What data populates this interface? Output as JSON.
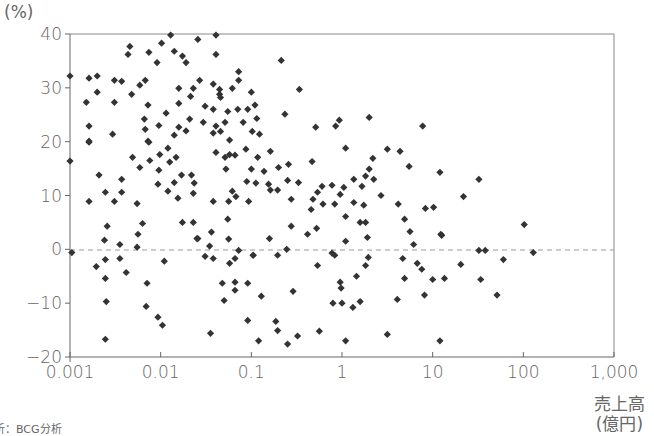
{
  "chart_data": {
    "type": "scatter",
    "title": "",
    "xlabel": "売上高（億円）",
    "ylabel": "(%)",
    "xscale": "log",
    "xlim": [
      0.001,
      1000
    ],
    "ylim": [
      -20,
      40
    ],
    "x_ticks": [
      "0.001",
      "0.01",
      "0.1",
      "1",
      "10",
      "100",
      "1,000"
    ],
    "y_ticks": [
      "40",
      "30",
      "20",
      "10",
      "0",
      "−10",
      "−20"
    ],
    "reference_line": {
      "y": 0,
      "style": "dashed"
    },
    "grid": false,
    "marker": "diamond",
    "marker_color": "#333333",
    "source": "析：BCG分析",
    "points_log10x_y": [
      [
        -3.0,
        32.2
      ],
      [
        -2.79,
        31.8
      ],
      [
        -2.7,
        32.2
      ],
      [
        -2.7,
        29.2
      ],
      [
        -2.82,
        27.3
      ],
      [
        -2.79,
        22.9
      ],
      [
        -2.79,
        20.1
      ],
      [
        -2.51,
        31.4
      ],
      [
        -2.43,
        31.2
      ],
      [
        -2.51,
        27.3
      ],
      [
        -2.53,
        21.4
      ],
      [
        -2.36,
        36.2
      ],
      [
        -2.34,
        37.7
      ],
      [
        -2.32,
        28.8
      ],
      [
        -2.23,
        30.5
      ],
      [
        -2.17,
        31.4
      ],
      [
        -2.13,
        36.6
      ],
      [
        -2.04,
        34.7
      ],
      [
        -1.99,
        38.3
      ],
      [
        -1.89,
        39.8
      ],
      [
        -1.85,
        36.8
      ],
      [
        -1.76,
        35.9
      ],
      [
        -1.72,
        34.7
      ],
      [
        -1.8,
        29.9
      ],
      [
        -1.64,
        29.9
      ],
      [
        -1.67,
        28.4
      ],
      [
        -1.8,
        27.1
      ],
      [
        -1.94,
        25.3
      ],
      [
        -2.14,
        26.8
      ],
      [
        -2.18,
        24.2
      ],
      [
        -2.17,
        22.3
      ],
      [
        -2.02,
        23.0
      ],
      [
        -1.8,
        22.7
      ],
      [
        -1.85,
        21.2
      ],
      [
        -1.72,
        22.0
      ],
      [
        -1.68,
        24.2
      ],
      [
        -2.14,
        20.1
      ],
      [
        -2.79,
        19.9
      ],
      [
        -3.0,
        16.4
      ],
      [
        -2.68,
        13.8
      ],
      [
        -2.61,
        10.6
      ],
      [
        -2.79,
        8.9
      ],
      [
        -2.51,
        8.9
      ],
      [
        -2.43,
        13.0
      ],
      [
        -2.43,
        10.6
      ],
      [
        -2.31,
        17.1
      ],
      [
        -2.23,
        15.2
      ],
      [
        -2.26,
        8.5
      ],
      [
        -2.13,
        19.9
      ],
      [
        -2.12,
        16.5
      ],
      [
        -2.02,
        14.7
      ],
      [
        -2.01,
        17.6
      ],
      [
        -1.92,
        18.8
      ],
      [
        -1.9,
        16.2
      ],
      [
        -1.83,
        17.1
      ],
      [
        -2.03,
        12.1
      ],
      [
        -1.92,
        10.8
      ],
      [
        -1.85,
        12.4
      ],
      [
        -1.77,
        13.8
      ],
      [
        -1.66,
        13.8
      ],
      [
        -1.63,
        12.3
      ],
      [
        -1.64,
        10.4
      ],
      [
        -1.81,
        9.5
      ],
      [
        -2.59,
        4.3
      ],
      [
        -2.62,
        1.7
      ],
      [
        -2.2,
        4.8
      ],
      [
        -2.25,
        2.8
      ],
      [
        -2.45,
        0.9
      ],
      [
        -2.26,
        0.4
      ],
      [
        -1.76,
        5.0
      ],
      [
        -1.64,
        5.0
      ],
      [
        -1.6,
        2.0
      ],
      [
        -2.98,
        -0.6
      ],
      [
        -2.71,
        -3.2
      ],
      [
        -2.61,
        -1.9
      ],
      [
        -2.45,
        -1.7
      ],
      [
        -2.61,
        -5.4
      ],
      [
        -2.38,
        -4.3
      ],
      [
        -2.15,
        -6.3
      ],
      [
        -1.96,
        -2.2
      ],
      [
        -2.6,
        -9.7
      ],
      [
        -2.16,
        -10.6
      ],
      [
        -2.03,
        -12.6
      ],
      [
        -1.98,
        -14.1
      ],
      [
        -2.61,
        -16.7
      ],
      [
        -1.59,
        39.0
      ],
      [
        -1.39,
        39.8
      ],
      [
        -1.39,
        36.2
      ],
      [
        -0.67,
        35.1
      ],
      [
        -1.14,
        33.0
      ],
      [
        -1.57,
        31.4
      ],
      [
        -1.42,
        30.7
      ],
      [
        -1.14,
        31.4
      ],
      [
        -1.21,
        29.9
      ],
      [
        -1.35,
        29.7
      ],
      [
        -0.47,
        29.7
      ],
      [
        -1.35,
        28.8
      ],
      [
        -1.34,
        28.2
      ],
      [
        -1.0,
        29.2
      ],
      [
        -1.51,
        26.6
      ],
      [
        -1.42,
        26.0
      ],
      [
        -1.26,
        25.6
      ],
      [
        -1.15,
        26.0
      ],
      [
        -1.04,
        26.0
      ],
      [
        -0.96,
        26.8
      ],
      [
        -0.63,
        25.1
      ],
      [
        -1.53,
        23.6
      ],
      [
        -1.39,
        22.9
      ],
      [
        -1.29,
        23.6
      ],
      [
        -1.09,
        23.6
      ],
      [
        -0.94,
        24.3
      ],
      [
        -0.29,
        22.7
      ],
      [
        -1.42,
        21.6
      ],
      [
        -1.34,
        21.9
      ],
      [
        -1.24,
        20.3
      ],
      [
        -0.99,
        21.9
      ],
      [
        -0.91,
        21.4
      ],
      [
        -1.24,
        17.6
      ],
      [
        -1.39,
        18.0
      ],
      [
        -1.29,
        17.1
      ],
      [
        -1.18,
        17.5
      ],
      [
        -1.06,
        18.6
      ],
      [
        -0.93,
        17.1
      ],
      [
        -0.79,
        18.2
      ],
      [
        -0.59,
        15.8
      ],
      [
        -0.33,
        16.3
      ],
      [
        -1.28,
        14.9
      ],
      [
        -1.0,
        14.9
      ],
      [
        -0.86,
        14.5
      ],
      [
        -0.7,
        15.2
      ],
      [
        -0.48,
        12.4
      ],
      [
        -1.05,
        12.6
      ],
      [
        -0.95,
        12.3
      ],
      [
        -0.81,
        12.1
      ],
      [
        -0.6,
        12.8
      ],
      [
        -1.21,
        10.8
      ],
      [
        -0.79,
        11.0
      ],
      [
        -0.71,
        11.0
      ],
      [
        -1.42,
        8.9
      ],
      [
        -1.25,
        8.9
      ],
      [
        -1.17,
        9.8
      ],
      [
        -1.03,
        8.9
      ],
      [
        -0.56,
        9.3
      ],
      [
        -0.27,
        10.6
      ],
      [
        -0.32,
        9.3
      ],
      [
        -0.22,
        11.7
      ],
      [
        -0.21,
        8.4
      ],
      [
        -0.34,
        7.4
      ],
      [
        -1.26,
        5.6
      ],
      [
        -0.56,
        4.3
      ],
      [
        -0.28,
        3.9
      ],
      [
        -0.38,
        2.8
      ],
      [
        -1.44,
        3.2
      ],
      [
        -1.59,
        2.0
      ],
      [
        -1.25,
        1.9
      ],
      [
        -0.8,
        2.0
      ],
      [
        -1.46,
        0.6
      ],
      [
        -1.14,
        -0.2
      ],
      [
        -0.71,
        -1.1
      ],
      [
        -0.08,
        -1.1
      ],
      [
        -0.98,
        -1.1
      ],
      [
        -0.61,
        0.0
      ],
      [
        -1.51,
        -1.3
      ],
      [
        -1.42,
        -1.7
      ],
      [
        -1.24,
        -2.6
      ],
      [
        -1.18,
        -1.7
      ],
      [
        -0.98,
        -1.1
      ],
      [
        -0.27,
        -3.0
      ],
      [
        -1.32,
        -6.3
      ],
      [
        -1.18,
        -6.1
      ],
      [
        -1.18,
        -7.6
      ],
      [
        -1.04,
        -6.3
      ],
      [
        -1.3,
        -9.5
      ],
      [
        -0.89,
        -8.7
      ],
      [
        -0.54,
        -7.8
      ],
      [
        0.0,
        -10.0
      ],
      [
        -1.04,
        -13.2
      ],
      [
        -0.73,
        -13.4
      ],
      [
        -0.71,
        -15.1
      ],
      [
        -1.45,
        -15.6
      ],
      [
        -0.92,
        -17.0
      ],
      [
        -0.6,
        -17.6
      ],
      [
        -0.49,
        -16.1
      ],
      [
        -0.25,
        -15.2
      ],
      [
        -0.03,
        24.0
      ],
      [
        -0.07,
        22.9
      ],
      [
        0.3,
        24.5
      ],
      [
        0.89,
        22.9
      ],
      [
        0.04,
        18.8
      ],
      [
        0.5,
        18.6
      ],
      [
        0.64,
        18.2
      ],
      [
        0.34,
        16.9
      ],
      [
        0.74,
        15.4
      ],
      [
        0.3,
        14.9
      ],
      [
        0.26,
        13.6
      ],
      [
        0.35,
        13.0
      ],
      [
        0.13,
        13.0
      ],
      [
        1.08,
        14.3
      ],
      [
        1.51,
        13.0
      ],
      [
        -0.11,
        11.9
      ],
      [
        0.02,
        11.5
      ],
      [
        0.22,
        11.7
      ],
      [
        -0.02,
        10.2
      ],
      [
        0.43,
        10.0
      ],
      [
        1.34,
        9.8
      ],
      [
        -0.08,
        8.4
      ],
      [
        0.13,
        8.7
      ],
      [
        0.24,
        8.2
      ],
      [
        0.62,
        8.4
      ],
      [
        0.92,
        7.6
      ],
      [
        1.01,
        7.8
      ],
      [
        0.04,
        6.1
      ],
      [
        0.2,
        5.0
      ],
      [
        0.26,
        5.0
      ],
      [
        0.69,
        5.6
      ],
      [
        0.75,
        3.3
      ],
      [
        1.09,
        2.8
      ],
      [
        0.04,
        1.5
      ],
      [
        0.28,
        2.2
      ],
      [
        0.79,
        0.9
      ],
      [
        -0.11,
        -0.7
      ],
      [
        0.29,
        -1.5
      ],
      [
        0.26,
        -3.0
      ],
      [
        0.16,
        -5.0
      ],
      [
        -0.02,
        -6.1
      ],
      [
        -0.01,
        -7.2
      ],
      [
        0.67,
        -1.7
      ],
      [
        0.83,
        -2.6
      ],
      [
        0.88,
        -3.7
      ],
      [
        0.69,
        -5.4
      ],
      [
        1.0,
        -5.6
      ],
      [
        1.31,
        -2.8
      ],
      [
        1.51,
        -0.2
      ],
      [
        1.53,
        -5.6
      ],
      [
        0.61,
        -9.3
      ],
      [
        0.91,
        -8.5
      ],
      [
        -0.1,
        -10.0
      ],
      [
        0.2,
        -9.7
      ],
      [
        0.12,
        -10.8
      ],
      [
        0.04,
        -17.0
      ],
      [
        0.5,
        -15.8
      ],
      [
        1.08,
        -17.0
      ],
      [
        1.1,
        2.6
      ],
      [
        2.01,
        4.6
      ],
      [
        1.58,
        -0.2
      ],
      [
        2.11,
        -0.6
      ],
      [
        1.78,
        -1.9
      ],
      [
        1.13,
        -5.4
      ],
      [
        1.71,
        -8.5
      ]
    ]
  },
  "axes": {
    "y_unit": "(%)",
    "x_unit_line1": "売上高",
    "x_unit_line2": "(億円)"
  },
  "footer": {
    "source": "析：BCG分析"
  }
}
